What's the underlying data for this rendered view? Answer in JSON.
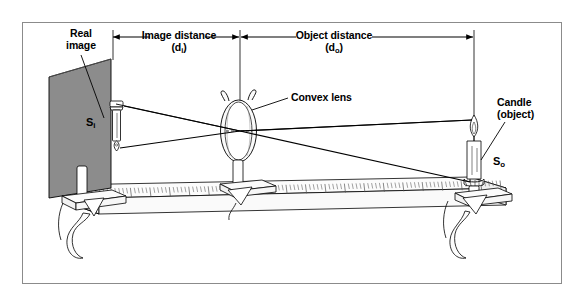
{
  "figure": {
    "kind": "optical-bench-convex-lens-ray-diagram",
    "background": "#ffffff",
    "frame_color": "#8b8b8b",
    "screen_fill": "#8c8c8c",
    "ink": "#000000"
  },
  "labels": {
    "real_image": {
      "line1": "Real",
      "line2": "image"
    },
    "image_distance": {
      "line1": "Image distance",
      "symbol_pre": "(d",
      "symbol_sub": "i",
      "symbol_post": ")"
    },
    "object_distance": {
      "line1": "Object distance",
      "symbol_pre": "(d",
      "symbol_sub": "o",
      "symbol_post": ")"
    },
    "convex_lens": "Convex lens",
    "candle": {
      "line1": "Candle",
      "line2": "(object)"
    },
    "s_image": {
      "base": "S",
      "sub": "i"
    },
    "s_object": {
      "base": "S",
      "sub": "o"
    }
  },
  "chart_data": {
    "type": "diagram",
    "elements": [
      {
        "name": "screen",
        "role": "projection-screen",
        "x_px": 75,
        "label": "S_i"
      },
      {
        "name": "convex-lens",
        "role": "converging-lens",
        "x_px": 240
      },
      {
        "name": "candle",
        "role": "object",
        "x_px": 474,
        "label": "S_o"
      },
      {
        "name": "optical-bench",
        "role": "ruler-track"
      }
    ],
    "dimensions": [
      {
        "name": "image distance",
        "symbol": "d_i",
        "from_px": 113,
        "to_px": 240
      },
      {
        "name": "object distance",
        "symbol": "d_o",
        "from_px": 240,
        "to_px": 474
      }
    ],
    "rays": [
      {
        "from": "object-tip",
        "via": "lens-center",
        "to": "image-base"
      },
      {
        "from": "object-base",
        "via": "lens-center",
        "to": "image-tip"
      }
    ],
    "note": "Image is real and inverted"
  }
}
